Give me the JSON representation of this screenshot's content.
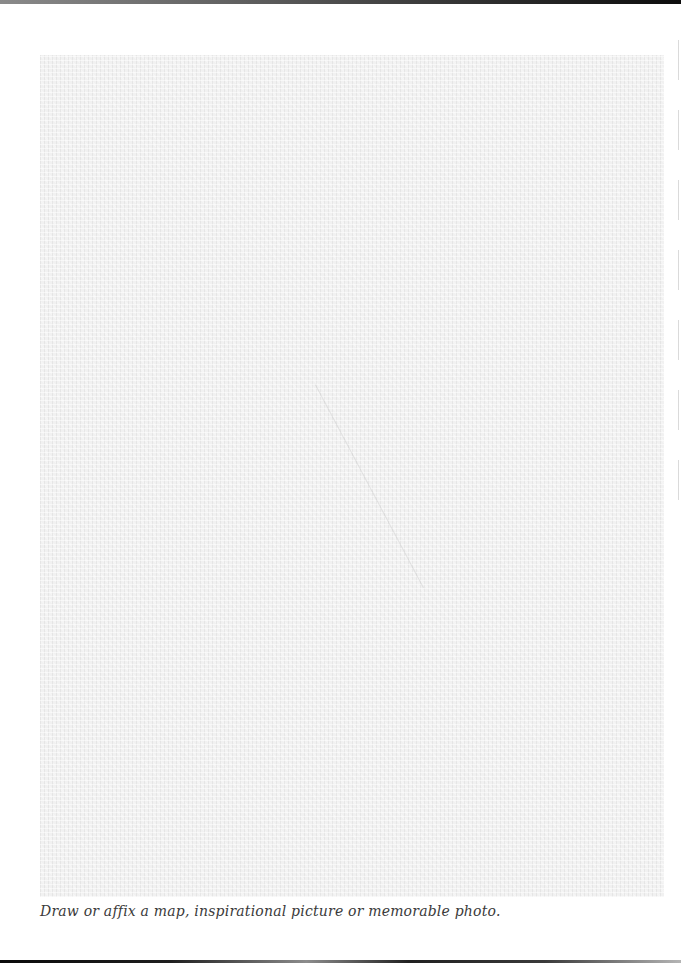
{
  "page": {
    "photo_area": {
      "description": "blank textured paper area for drawing or affixing an image",
      "fill_color": "#f1f1f1"
    },
    "caption": "Draw or affix a map, inspirational picture or memorable photo."
  },
  "colors": {
    "background": "#ffffff",
    "caption_text": "#3a3a3a",
    "texture": "#f1f1f1"
  }
}
